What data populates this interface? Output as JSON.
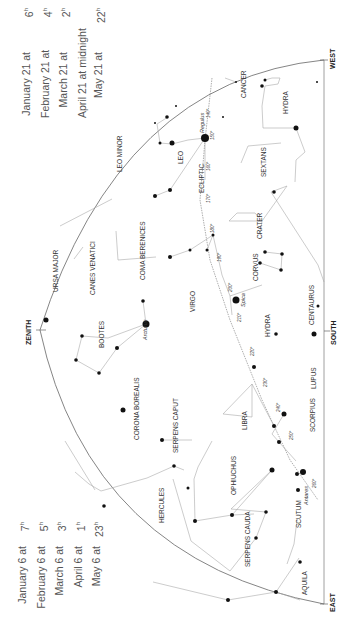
{
  "times_west": [
    {
      "date": "January 21 at",
      "hour": "6",
      "unit": "h"
    },
    {
      "date": "February 21 at",
      "hour": "4",
      "unit": "h"
    },
    {
      "date": "March 21 at",
      "hour": "2",
      "unit": "h"
    },
    {
      "date": "April 21 at midnight",
      "hour": "",
      "unit": ""
    },
    {
      "date": "May 21 at",
      "hour": "22",
      "unit": "h"
    }
  ],
  "times_east": [
    {
      "date": "January 6 at",
      "hour": "7",
      "unit": "h"
    },
    {
      "date": "February 6 at",
      "hour": "5",
      "unit": "h"
    },
    {
      "date": "March 6 at",
      "hour": "3",
      "unit": "h"
    },
    {
      "date": "April 6 at",
      "hour": "1",
      "unit": "h"
    },
    {
      "date": "May 6 at",
      "hour": "23",
      "unit": "h"
    }
  ],
  "directions": {
    "west": "WEST",
    "zenith": "ZENITH",
    "south": "SOUTH",
    "east": "EAST"
  },
  "constellations": {
    "cancer": "CANCER",
    "hydra_w": "HYDRA",
    "leo_minor": "LEO MINOR",
    "leo": "LEO",
    "sextans": "SEXTANS",
    "ursa_major": "URSA MAJOR",
    "canes_venatici": "CANES VENATICI",
    "coma_berenices": "COMA BERENICES",
    "crater": "CRATER",
    "corvus": "CORVUS",
    "virgo": "VIRGO",
    "hydra_s": "HYDRA",
    "centaurus": "CENTAURUS",
    "bootes": "BOOTES",
    "corona_borealis": "CORONA BOREALIS",
    "libra": "LIBRA",
    "lupus": "LUPUS",
    "serpens_caput": "SERPENS CAPUT",
    "scorpius": "SCORPIUS",
    "hercules": "HERCULES",
    "ophiuchus": "OPHIUCHUS",
    "scutum": "SCUTUM",
    "serpens_cauda": "SERPENS CAUDA",
    "aquila": "AQUILA"
  },
  "stars": {
    "regulus": "Regulus",
    "spica": "Spica",
    "arcturus": "Arcturus",
    "antares": "Antares"
  },
  "ecliptic": {
    "label": "ECLIPTIC",
    "degrees": [
      "140°",
      "150°",
      "160°",
      "170°",
      "180°",
      "190°",
      "200°",
      "210°",
      "220°",
      "230°",
      "240°",
      "250°",
      "260°"
    ]
  }
}
